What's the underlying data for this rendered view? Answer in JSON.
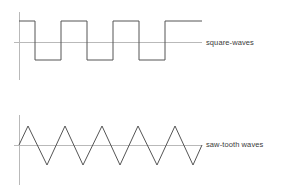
{
  "figure": {
    "title": "",
    "background_color": "#ffffff",
    "trace_color": "#555555",
    "axis_color": "#b9b9b9",
    "label_color": "#3a3a3a",
    "width": 286,
    "height": 194
  },
  "panels": [
    {
      "id": "square-waves",
      "label": "square-waves",
      "waveform_type": "square",
      "cycles": 3.5,
      "starts_high": true,
      "ends_high": true,
      "axis": {
        "y_axis_x": 19,
        "y_axis_top": 12,
        "y_axis_bottom": 80,
        "x_axis_y": 42,
        "x_axis_left": 14,
        "x_axis_right": 202
      },
      "geometry": {
        "top_y": 21,
        "baseline_y": 42,
        "bottom_y": 60,
        "start_x": 19,
        "end_x": 202,
        "period_px": 52
      }
    },
    {
      "id": "saw-tooth-waves",
      "label": "saw-tooth waves",
      "waveform_type": "triangle",
      "cycles": 5,
      "starts_at_zero": true,
      "axis": {
        "y_axis_x": 19,
        "y_axis_top": 115,
        "y_axis_bottom": 185,
        "x_axis_y": 145,
        "x_axis_left": 14,
        "x_axis_right": 202
      },
      "geometry": {
        "peak_y": 126,
        "baseline_y": 145,
        "trough_y": 165,
        "start_x": 19,
        "end_x": 202,
        "period_px": 36.6
      }
    }
  ],
  "chart_data": {
    "type": "line",
    "title": "",
    "xlabel": "",
    "ylabel": "",
    "grid": false,
    "legend_position": "right",
    "series": [
      {
        "name": "square-waves",
        "waveform": "square",
        "amplitude_high": 1,
        "amplitude_low": -0.85,
        "cycles": 3.5,
        "phase": "starts high",
        "points_x": [
          19,
          35,
          35,
          61,
          61,
          87,
          87,
          113,
          113,
          139,
          139,
          165,
          165,
          191,
          191,
          202
        ],
        "points_y": [
          21,
          21,
          60,
          60,
          21,
          21,
          60,
          60,
          21,
          21,
          60,
          60,
          21,
          21,
          21,
          21
        ]
      },
      {
        "name": "saw-tooth waves",
        "waveform": "triangle",
        "amplitude_high": 1,
        "amplitude_low": -1,
        "cycles": 5,
        "phase": "starts at zero rising",
        "points_x": [
          19,
          28,
          47,
          65,
          83,
          102,
          120,
          138,
          157,
          175,
          193,
          202
        ],
        "points_y": [
          145,
          126,
          165,
          126,
          165,
          126,
          165,
          126,
          165,
          126,
          165,
          145
        ]
      }
    ]
  },
  "labels": {
    "square": "square-waves",
    "sawtooth": "saw-tooth waves"
  }
}
